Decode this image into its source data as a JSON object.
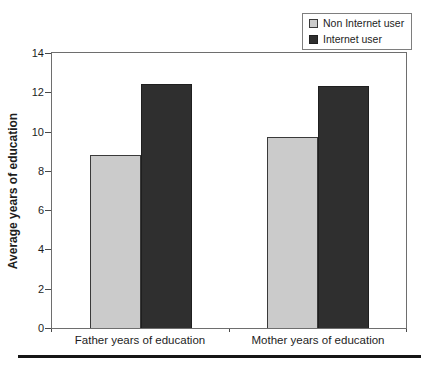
{
  "figure": {
    "background": "#ffffff"
  },
  "chart_data": {
    "type": "bar",
    "title": "",
    "xlabel": "",
    "ylabel": "Average years of education",
    "ylim": [
      0,
      14
    ],
    "yticks": [
      0,
      2,
      4,
      6,
      8,
      10,
      12,
      14
    ],
    "grid": false,
    "legend_position": "top-right",
    "categories": [
      "Father years of education",
      "Mother years of education"
    ],
    "series": [
      {
        "name": "Non Internet user",
        "values": [
          8.8,
          9.7
        ],
        "fill": "#cbcbcb",
        "border": "#3a3a3a"
      },
      {
        "name": "Internet user",
        "values": [
          12.4,
          12.3
        ],
        "fill": "#2f2f2f",
        "border": "#1f1f1f"
      }
    ],
    "axis_color": "#6e6e6e",
    "tick_color": "#4a4a4a",
    "text_color": "#1d1d1d"
  }
}
